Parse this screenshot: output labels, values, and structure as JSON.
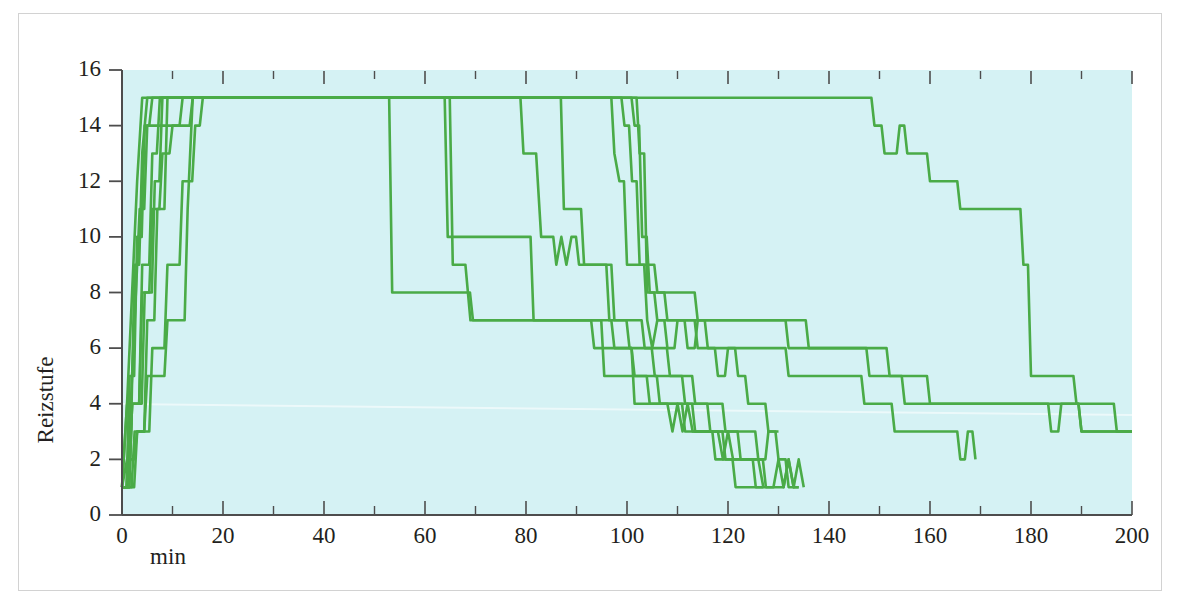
{
  "figure": {
    "background_color": "#ffffff",
    "frame_color": "#d2d2d2"
  },
  "chart_data": {
    "type": "line",
    "title": "",
    "subtitle": "",
    "xlabel": "min",
    "ylabel": "Reizstufe",
    "xlim": [
      0,
      200
    ],
    "ylim": [
      0,
      16
    ],
    "xticks": [
      0,
      20,
      40,
      60,
      80,
      100,
      120,
      140,
      160,
      180,
      200
    ],
    "xtick_labels": [
      "0",
      "20",
      "40",
      "60",
      "80",
      "100",
      "120",
      "140",
      "160",
      "180",
      "200"
    ],
    "xminor_ticks": [
      10,
      30,
      50,
      70,
      90,
      110,
      130,
      150,
      170,
      190
    ],
    "yticks": [
      0,
      2,
      4,
      6,
      8,
      10,
      12,
      14,
      16
    ],
    "ytick_labels": [
      "0",
      "2",
      "4",
      "6",
      "8",
      "10",
      "12",
      "14",
      "16"
    ],
    "grid": false,
    "legend": "none",
    "plot_background_color": "#d5f2f4",
    "line_color": "#4aab47",
    "line_width": 2.6,
    "step_style": "linear-segments",
    "series": [
      {
        "name": "subject-1",
        "x": [
          0,
          1.0,
          2.0,
          3.0,
          4.0,
          52.0,
          53.5,
          68.0,
          69.5,
          96.0,
          97.5,
          100.0,
          101.5,
          105.0,
          106.5,
          110.0,
          111.5,
          116.0,
          117.5,
          120.0,
          121.5,
          124.0,
          125.5,
          127.0
        ],
        "y": [
          1,
          4,
          8,
          12,
          15,
          15,
          8,
          8,
          7,
          7,
          6,
          6,
          5,
          5,
          4,
          4,
          3,
          3,
          2,
          2,
          1,
          1,
          1,
          1
        ]
      },
      {
        "name": "subject-2",
        "x": [
          0,
          1.5,
          2.5,
          3.5,
          5.0,
          14.0,
          15.0,
          63.0,
          64.5,
          66.0,
          80.0,
          81.5,
          94.0,
          95.5,
          103.0,
          104.5,
          112.0,
          113.5,
          118.0,
          119.5,
          124.0,
          125.5,
          129.0,
          130.0,
          131.0,
          132.0,
          133.0,
          134.0,
          135.0
        ],
        "y": [
          1,
          3,
          7,
          11,
          14,
          15,
          15,
          15,
          10,
          10,
          10,
          7,
          7,
          5,
          5,
          4,
          4,
          3,
          3,
          2,
          2,
          1,
          1,
          2,
          1,
          2,
          1,
          2,
          1
        ]
      },
      {
        "name": "subject-3",
        "x": [
          0,
          1.0,
          2.5,
          4.0,
          5.0,
          13.5,
          14.5,
          63.5,
          65.5,
          68.0,
          69.0,
          92.0,
          93.5,
          100.0,
          101.5,
          108.0,
          109.0,
          110.0,
          111.0,
          112.0,
          113.0,
          114.5,
          118.0,
          119.0,
          120.0,
          121.0,
          122.5,
          126.0,
          127.0
        ],
        "y": [
          1,
          4,
          9,
          13,
          15,
          15,
          15,
          15,
          9,
          9,
          7,
          7,
          6,
          6,
          4,
          4,
          3,
          4,
          3,
          4,
          3,
          3,
          3,
          2,
          3,
          2,
          2,
          2,
          1
        ]
      },
      {
        "name": "subject-4",
        "x": [
          0,
          1.5,
          3.0,
          4.5,
          6.0,
          78.0,
          79.5,
          82.0,
          83.0,
          84.5,
          86.0,
          87.0,
          88.0,
          89.0,
          90.5,
          95.0,
          96.5,
          99.0,
          100.5,
          104.0,
          105.5,
          110.0,
          111.5,
          115.0,
          116.5,
          121.0,
          122.5,
          126.0,
          127.5,
          131.0,
          132.0,
          133.0,
          134.0
        ],
        "y": [
          1,
          5,
          10,
          14,
          15,
          15,
          13,
          13,
          10,
          10,
          9,
          10,
          9,
          10,
          9,
          9,
          7,
          7,
          6,
          6,
          5,
          5,
          4,
          4,
          3,
          3,
          2,
          2,
          1,
          1,
          2,
          1,
          1
        ]
      },
      {
        "name": "subject-5",
        "x": [
          0,
          2.0,
          4.0,
          6.0,
          7.5,
          86.0,
          87.5,
          90.0,
          91.5,
          96.0,
          97.5,
          102.0,
          103.5,
          107.0,
          108.5,
          112.0,
          113.5,
          118.0,
          119.5,
          124.0,
          126.0,
          128.0,
          130.0,
          132.0,
          134.0
        ],
        "y": [
          1,
          4,
          9,
          13,
          15,
          15,
          11,
          11,
          9,
          9,
          7,
          7,
          6,
          6,
          5,
          5,
          4,
          4,
          3,
          3,
          2,
          3,
          2,
          1,
          1
        ]
      },
      {
        "name": "subject-6",
        "x": [
          0,
          2.0,
          4.5,
          6.5,
          8.0,
          96.0,
          97.5,
          98.5,
          100.0,
          101.5,
          104.0,
          105.0,
          106.0,
          108.0,
          110.0,
          112.0,
          114.0,
          116.0,
          118.0,
          120.0,
          122.0,
          124.0,
          126.0,
          128.0,
          130.0
        ],
        "y": [
          1,
          4,
          8,
          12,
          15,
          15,
          13,
          12,
          9,
          9,
          7,
          6,
          7,
          6,
          7,
          6,
          7,
          6,
          5,
          6,
          5,
          4,
          4,
          3,
          3
        ]
      },
      {
        "name": "subject-7",
        "x": [
          0,
          2.5,
          5.0,
          7.0,
          9.0,
          98.0,
          99.5,
          101.0,
          102.5,
          104.0,
          106.0,
          108.0,
          110.0,
          112.0,
          114.0,
          117.0,
          120.0,
          124.0,
          128.0,
          132.0,
          136.0,
          140.0,
          145.0,
          147.0,
          150.0,
          153.0,
          156.0,
          160.0,
          166.0,
          167.5,
          169.0
        ],
        "y": [
          1,
          3,
          7,
          11,
          15,
          15,
          14,
          12,
          9,
          9,
          8,
          7,
          7,
          7,
          6,
          6,
          6,
          6,
          6,
          5,
          5,
          5,
          5,
          4,
          4,
          3,
          3,
          3,
          2,
          3,
          2
        ]
      },
      {
        "name": "subject-8",
        "x": [
          0,
          1.0,
          3.0,
          5.0,
          7.0,
          9.0,
          11.0,
          13.0,
          14.0,
          100.0,
          101.5,
          103.0,
          104.5,
          106.0,
          112.0,
          118.0,
          124.0,
          130.0,
          136.0,
          142.0,
          146.0,
          148.0,
          152.0,
          155.0,
          157.0,
          160.0,
          166.0,
          172.0,
          178.0,
          184.0,
          190.0,
          196.0,
          200.0
        ],
        "y": [
          1,
          2,
          3,
          5,
          5,
          7,
          7,
          11,
          15,
          15,
          14,
          10,
          8,
          7,
          7,
          7,
          7,
          7,
          6,
          6,
          6,
          5,
          5,
          4,
          4,
          4,
          4,
          4,
          4,
          4,
          3,
          3,
          3
        ]
      },
      {
        "name": "subject-9",
        "x": [
          0,
          3.0,
          6.0,
          9.0,
          12.0,
          14.5,
          16.0,
          101.0,
          102.5,
          104.0,
          108.0,
          114.0,
          120.0,
          126.0,
          132.0,
          138.0,
          144.0,
          148.0,
          152.0,
          156.0,
          160.0,
          164.0,
          170.0,
          176.0,
          180.0,
          184.0,
          186.0,
          190.0,
          195.0,
          200.0
        ],
        "y": [
          1,
          3,
          6,
          9,
          12,
          14,
          15,
          15,
          13,
          8,
          8,
          7,
          7,
          7,
          6,
          6,
          6,
          6,
          5,
          5,
          4,
          4,
          4,
          4,
          4,
          3,
          4,
          3,
          3,
          3
        ]
      },
      {
        "name": "subject-10",
        "x": [
          0,
          2.0,
          4.0,
          6.0,
          8.0,
          10.0,
          12.0,
          14.0,
          146.0,
          149.0,
          151.0,
          152.5,
          154.0,
          155.5,
          157.0,
          160.0,
          163.0,
          166.0,
          169.0,
          172.0,
          177.0,
          178.5,
          180.0,
          186.0,
          189.0,
          192.0,
          197.0,
          200.0
        ],
        "y": [
          1,
          4,
          8,
          11,
          13,
          14,
          15,
          15,
          15,
          14,
          13,
          13,
          14,
          13,
          13,
          12,
          12,
          11,
          11,
          11,
          11,
          9,
          5,
          5,
          4,
          4,
          3,
          3
        ]
      }
    ]
  },
  "axes": {
    "y_title": "Reizstufe",
    "x_title": "min"
  }
}
